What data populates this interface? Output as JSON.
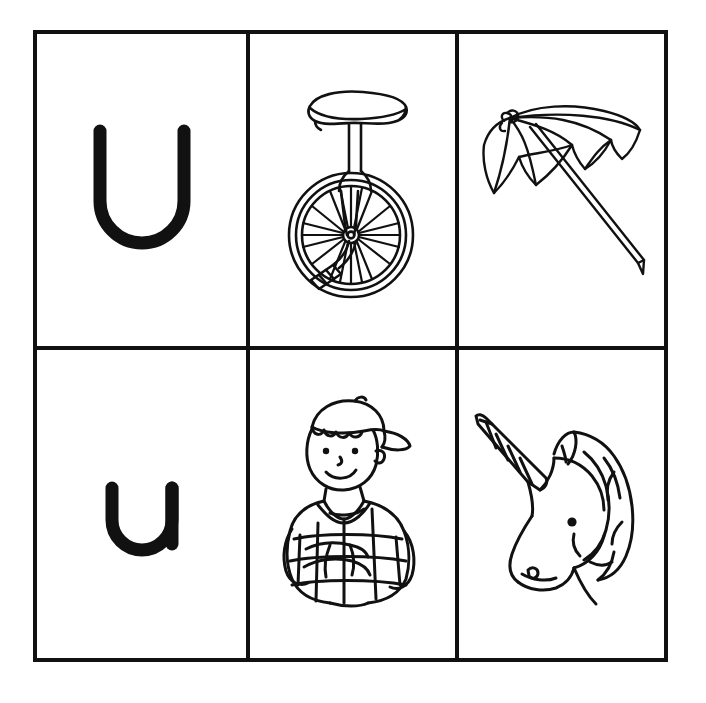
{
  "page": {
    "background_color": "#ffffff",
    "ink_color": "#111111",
    "border_color": "#111111",
    "grid": {
      "columns": 3,
      "rows": 2
    }
  },
  "cells": [
    {
      "id": "cell-uppercase-u",
      "row": 1,
      "column": 1,
      "kind": "letter",
      "letter": "U",
      "letter_case": "uppercase",
      "name": "uppercase-letter-u"
    },
    {
      "id": "cell-unicycle",
      "row": 1,
      "column": 2,
      "kind": "illustration",
      "subject": "unicycle",
      "name": "unicycle-illustration"
    },
    {
      "id": "cell-umbrella",
      "row": 1,
      "column": 3,
      "kind": "illustration",
      "subject": "umbrella",
      "name": "umbrella-illustration"
    },
    {
      "id": "cell-lowercase-u",
      "row": 2,
      "column": 1,
      "kind": "letter",
      "letter": "u",
      "letter_case": "lowercase",
      "name": "lowercase-letter-u"
    },
    {
      "id": "cell-uniform",
      "row": 2,
      "column": 2,
      "kind": "illustration",
      "subject": "uniform",
      "name": "uniform-boy-illustration"
    },
    {
      "id": "cell-unicorn",
      "row": 2,
      "column": 3,
      "kind": "illustration",
      "subject": "unicorn",
      "name": "unicorn-illustration"
    }
  ]
}
